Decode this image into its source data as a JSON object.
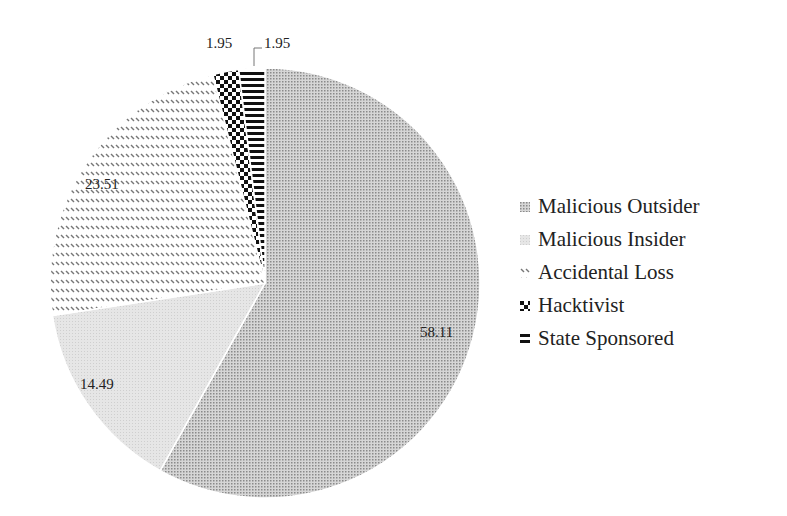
{
  "chart_data": {
    "type": "pie",
    "title": "",
    "categories": [
      "Malicious Outsider",
      "Malicious Insider",
      "Accidental Loss",
      "Hacktivist",
      "State Sponsored"
    ],
    "values": [
      58.11,
      14.49,
      23.51,
      1.95,
      1.95
    ],
    "data_labels": [
      "58.11",
      "14.49",
      "23.51",
      "1.95",
      "1.95"
    ],
    "legend_position": "right",
    "start_angle_deg": 0,
    "direction": "clockwise",
    "patterns": [
      "fine-dots-dark",
      "fine-dots-light",
      "diagonal-dashes",
      "checkerboard",
      "horizontal-stripes"
    ]
  },
  "legend": {
    "items": [
      {
        "label": "Malicious Outsider"
      },
      {
        "label": "Malicious Insider"
      },
      {
        "label": "Accidental Loss"
      },
      {
        "label": "Hacktivist"
      },
      {
        "label": "State Sponsored"
      }
    ]
  }
}
